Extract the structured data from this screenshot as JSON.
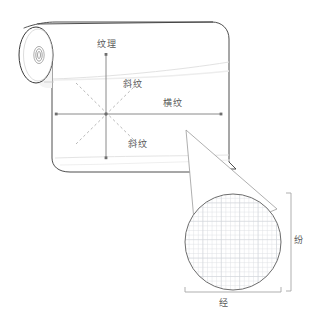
{
  "diagram": {
    "labels": {
      "grain_vertical": "纹理",
      "twill_upper": "斜纹",
      "cross_grain": "横纹",
      "twill_lower": "斜纹",
      "weft": "纷",
      "warp": "经"
    },
    "colors": {
      "outline": "#3a3a3a",
      "axis": "#7d7d7d",
      "dashed_axis": "#aaaaaa",
      "weave_grid": "#d9dce0",
      "label_text": "#5a5a5a",
      "bracket": "#9a9a9a",
      "background": "#ffffff",
      "fabric_fill": "#ffffff",
      "faint_fold": "#dcdcdc"
    },
    "parts": {
      "roll_end": "fabric-roll-end-ellipse",
      "roll_core": "fabric-roll-core",
      "sheet": "unrolled-fabric-sheet",
      "axis_star": "grain-direction-axes",
      "magnifier_cone": "magnifier-cone-pointer",
      "magnified_circle": "magnified-weave-circle",
      "weave_grid": "weave-grid-pattern"
    },
    "weave": {
      "grid_spacing_px": 4.6,
      "circle_radius_px": 48,
      "circle_center": {
        "x": 233,
        "y": 242
      }
    },
    "axis_star_center": {
      "x": 106,
      "y": 114
    },
    "axis_rays": [
      {
        "name": "up",
        "style": "solid",
        "label": "grain_vertical"
      },
      {
        "name": "down",
        "style": "solid",
        "label": null
      },
      {
        "name": "left",
        "style": "solid",
        "label": null
      },
      {
        "name": "right",
        "style": "solid",
        "label": "cross_grain"
      },
      {
        "name": "up-right",
        "style": "dashed",
        "label": "twill_upper"
      },
      {
        "name": "down-right",
        "style": "dashed",
        "label": "twill_lower"
      },
      {
        "name": "up-left",
        "style": "dashed",
        "label": null
      },
      {
        "name": "down-left",
        "style": "dashed",
        "label": null
      }
    ],
    "dimensions": [
      {
        "name": "weft-bracket",
        "orientation": "vertical",
        "label": "weft"
      },
      {
        "name": "warp-bracket",
        "orientation": "horizontal",
        "label": "warp"
      }
    ]
  }
}
